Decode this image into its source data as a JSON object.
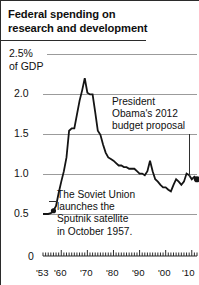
{
  "title": {
    "line1": "Federal spending on",
    "line2": "research and development"
  },
  "axes": {
    "y_unit_label": "2.5%",
    "y_unit_sub": "of GDP",
    "y_ticks": [
      "2.5%",
      "2.0",
      "1.5",
      "1.0",
      "0.5",
      "0"
    ],
    "y_tick_values": [
      2.5,
      2.0,
      1.5,
      1.0,
      0.5,
      0
    ],
    "x_ticks": [
      "'53",
      "'60",
      "'70",
      "'80",
      "'90",
      "'00",
      "'10"
    ],
    "x_tick_values": [
      1953,
      1960,
      1970,
      1980,
      1990,
      2000,
      2010
    ]
  },
  "annotations": {
    "obama": {
      "line1": "President",
      "line2": "Obama's 2012",
      "line3": "budget proposal"
    },
    "sputnik": {
      "line1": "The Soviet Union",
      "line2": "launches the",
      "line3": "Sputnik satellite",
      "line4": "in October 1957."
    }
  },
  "colors": {
    "line": "#141414",
    "grid": "#9b9b9b",
    "frame": "#2b2b2b",
    "text": "#101010",
    "marker": "#141414"
  },
  "chart_data": {
    "type": "line",
    "title": "Federal spending on research and development",
    "xlabel": "",
    "ylabel": "2.5% of GDP",
    "xlim": [
      1953,
      2012
    ],
    "ylim": [
      0,
      2.5
    ],
    "grid": true,
    "legend": false,
    "unit": "percent of GDP",
    "x": [
      1953,
      1954,
      1955,
      1956,
      1957,
      1958,
      1959,
      1960,
      1961,
      1962,
      1963,
      1964,
      1965,
      1966,
      1967,
      1968,
      1969,
      1970,
      1971,
      1972,
      1973,
      1974,
      1975,
      1976,
      1977,
      1978,
      1979,
      1980,
      1981,
      1982,
      1983,
      1984,
      1985,
      1986,
      1987,
      1988,
      1989,
      1990,
      1991,
      1992,
      1993,
      1994,
      1995,
      1996,
      1997,
      1998,
      1999,
      2000,
      2001,
      2002,
      2003,
      2004,
      2005,
      2006,
      2007,
      2008,
      2009,
      2010,
      2011,
      2012
    ],
    "values": [
      0.52,
      0.52,
      0.52,
      0.53,
      0.56,
      0.62,
      0.78,
      0.92,
      1.05,
      1.22,
      1.55,
      1.58,
      1.58,
      1.75,
      1.92,
      2.05,
      2.2,
      2.02,
      2.0,
      2.0,
      1.78,
      1.55,
      1.5,
      1.38,
      1.28,
      1.22,
      1.2,
      1.18,
      1.15,
      1.12,
      1.12,
      1.1,
      1.1,
      1.08,
      1.08,
      1.08,
      1.05,
      1.02,
      1.02,
      1.0,
      1.05,
      1.18,
      1.05,
      0.95,
      0.92,
      0.88,
      0.85,
      0.85,
      0.82,
      0.8,
      0.88,
      0.95,
      0.92,
      0.88,
      0.92,
      1.02,
      1.0,
      0.95,
      0.98,
      0.95
    ],
    "markers": [
      {
        "x": 1957,
        "y": 0.56,
        "label": "Sputnik October 1957"
      },
      {
        "x": 2012,
        "y": 0.95,
        "label": "President Obama's 2012 budget proposal"
      }
    ],
    "annotations": [
      {
        "text": "President Obama's 2012 budget proposal",
        "x": 2012,
        "y": 0.95
      },
      {
        "text": "The Soviet Union launches the Sputnik satellite in October 1957.",
        "x": 1957,
        "y": 0.56
      }
    ]
  }
}
